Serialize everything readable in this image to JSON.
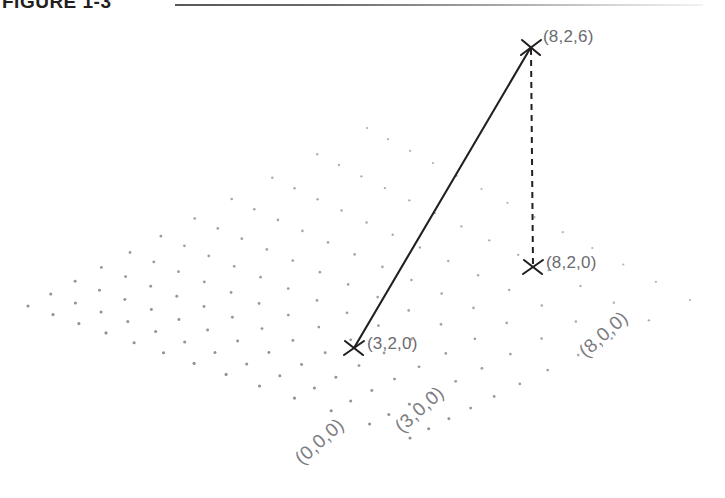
{
  "figure": {
    "caption": "FIGURE 1-3",
    "rule": "horizontal-rule"
  },
  "chart_data": {
    "type": "scatter",
    "title": "FIGURE 1-3",
    "xlabel": "",
    "ylabel": "",
    "grid": {
      "style": "perspective dot grid",
      "dot_color": "#8a8a8f",
      "rows": 11,
      "cols": 13
    },
    "points": [
      {
        "id": "p826",
        "label": "(8,2,6)",
        "coords": [
          8,
          2,
          6
        ],
        "px": 531,
        "py": 47,
        "marker": "x"
      },
      {
        "id": "p820",
        "label": "(8,2,0)",
        "coords": [
          8,
          2,
          0
        ],
        "px": 533,
        "py": 267,
        "marker": "x"
      },
      {
        "id": "p320",
        "label": "(3,2,0)",
        "coords": [
          3,
          2,
          0
        ],
        "px": 354,
        "py": 348,
        "marker": "x"
      }
    ],
    "segments": [
      {
        "id": "seg-solid",
        "from": "(3,2,0)",
        "to": "(8,2,6)",
        "style": "solid",
        "color": "#231f20"
      },
      {
        "id": "seg-dashed",
        "from": "(8,2,6)",
        "to": "(8,2,0)",
        "style": "dashed",
        "color": "#231f20"
      }
    ],
    "axis_labels": [
      {
        "id": "a000",
        "label": "(0,0,0)",
        "coords": [
          0,
          0,
          0
        ],
        "rotation": -42
      },
      {
        "id": "a300",
        "label": "(3,0,0)",
        "coords": [
          3,
          0,
          0
        ],
        "rotation": -42
      },
      {
        "id": "a800",
        "label": "(8,0,0)",
        "coords": [
          8,
          0,
          0
        ],
        "rotation": -42
      }
    ],
    "legend": [],
    "colors": {
      "ink": "#231f20",
      "label": "#6b6b70",
      "axis_label": "#7d7d82",
      "dot": "#8a8a8f",
      "background": "#ffffff"
    }
  }
}
